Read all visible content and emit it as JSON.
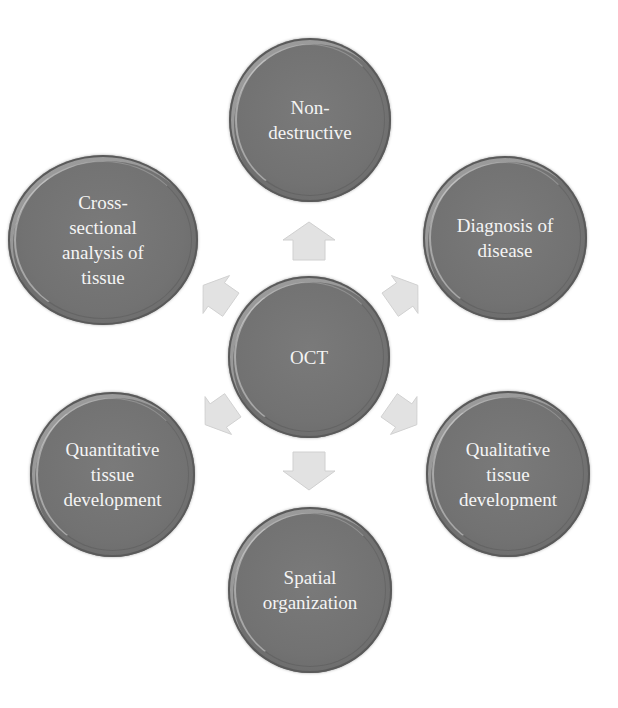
{
  "diagram": {
    "center": {
      "label": "OCT"
    },
    "nodes": [
      {
        "id": "top",
        "label": "Non-\ndestructive"
      },
      {
        "id": "upper-right",
        "label": "Diagnosis of\ndisease"
      },
      {
        "id": "lower-right",
        "label": "Qualitative\ntissue\ndevelopment"
      },
      {
        "id": "bottom",
        "label": "Spatial\norganization"
      },
      {
        "id": "lower-left",
        "label": "Quantitative\ntissue\ndevelopment"
      },
      {
        "id": "upper-left",
        "label": "Cross-\nsectional\nanalysis of\ntissue"
      }
    ],
    "colors": {
      "node_fill": "#737373",
      "node_text": "#f4f4f4",
      "arrow_fill": "#e2e2e2",
      "background": "#ffffff"
    }
  }
}
